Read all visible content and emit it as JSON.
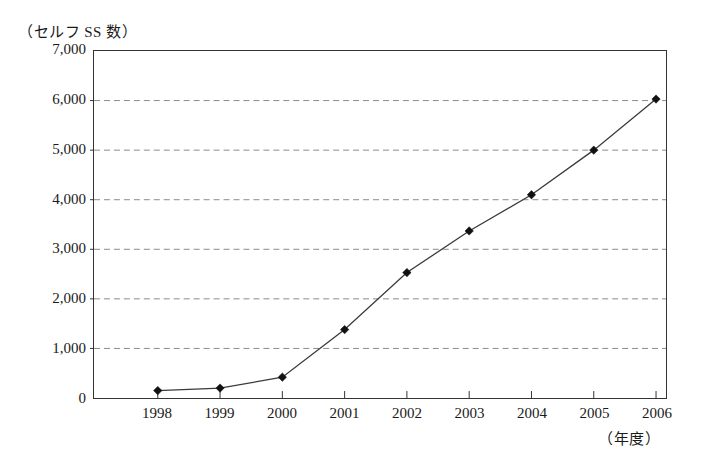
{
  "chart_data": {
    "type": "line",
    "title": "",
    "ylabel": "（セルフ SS 数）",
    "xlabel": "（年度）",
    "categories": [
      "1998",
      "1999",
      "2000",
      "2001",
      "2002",
      "2003",
      "2004",
      "2005",
      "2006"
    ],
    "values": [
      150,
      200,
      420,
      1380,
      2530,
      3370,
      4100,
      5000,
      6030
    ],
    "series": [
      {
        "name": "セルフ SS 数",
        "values": [
          150,
          200,
          420,
          1380,
          2530,
          3370,
          4100,
          5000,
          6030
        ]
      }
    ],
    "ylim": [
      0,
      7000
    ],
    "y_ticks": [
      0,
      1000,
      2000,
      3000,
      4000,
      5000,
      6000,
      7000
    ],
    "y_tick_labels": [
      "0",
      "1,000",
      "2,000",
      "3,000",
      "4,000",
      "5,000",
      "6,000",
      "7,000"
    ],
    "x_tick_labels": [
      "1998",
      "1999",
      "2000",
      "2001",
      "2002",
      "2003",
      "2004",
      "2005",
      "2006"
    ],
    "grid": true,
    "grid_axis": "y",
    "legend": false,
    "legend_position": "none",
    "marker": "diamond",
    "colors": {
      "line": "#3a3a3a",
      "marker": "#111111",
      "grid": "#8a8a8a",
      "frame": "#333333",
      "background": "#ffffff",
      "text": "#1a1a1a"
    }
  }
}
